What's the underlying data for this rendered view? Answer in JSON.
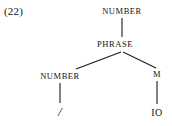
{
  "figure": {
    "example_label": "(22)",
    "type": "syntax-tree",
    "background_color": "#ffffff",
    "ink_color": "#1a1a1a"
  },
  "tree": {
    "nodes": [
      {
        "id": "n1",
        "label": "NUMBER",
        "kind": "category",
        "x": 122,
        "y": 12
      },
      {
        "id": "n2",
        "label": "PHRASE",
        "kind": "category",
        "x": 115,
        "y": 45
      },
      {
        "id": "n3",
        "label": "NUMBER",
        "kind": "category",
        "x": 60,
        "y": 77
      },
      {
        "id": "n4",
        "label": "M",
        "kind": "category",
        "x": 157,
        "y": 75
      },
      {
        "id": "n5",
        "label": "/",
        "kind": "terminal",
        "x": 60,
        "y": 112
      },
      {
        "id": "n6",
        "label": "IO",
        "kind": "terminal",
        "x": 157,
        "y": 113
      }
    ],
    "edges": [
      {
        "from": "n1",
        "to": "n2",
        "x1": 122,
        "y1": 18,
        "x2": 122,
        "y2": 37,
        "style": "vertical"
      },
      {
        "from": "n2",
        "to": "n3",
        "x1": 121,
        "y1": 52,
        "x2": 76,
        "y2": 69,
        "style": "diagonal-left"
      },
      {
        "from": "n2",
        "to": "n4",
        "x1": 123,
        "y1": 52,
        "x2": 156,
        "y2": 68,
        "style": "diagonal-right"
      },
      {
        "from": "n3",
        "to": "n5",
        "x1": 60,
        "y1": 83,
        "x2": 60,
        "y2": 103,
        "style": "vertical"
      },
      {
        "from": "n4",
        "to": "n6",
        "x1": 157,
        "y1": 81,
        "x2": 157,
        "y2": 104,
        "style": "vertical"
      }
    ]
  }
}
